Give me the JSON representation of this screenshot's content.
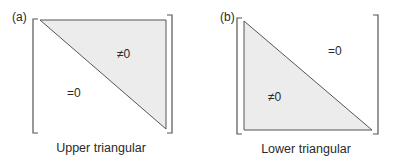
{
  "figure": {
    "colors": {
      "fill": "#ececec",
      "stroke": "#555555",
      "text": "#2a2a2a"
    },
    "panels": [
      {
        "id": "a",
        "label": "(a)",
        "caption": "Upper triangular",
        "nonzero_label": "≠0",
        "zero_label": "=0"
      },
      {
        "id": "b",
        "label": "(b)",
        "caption": "Lower triangular",
        "nonzero_label": "≠0",
        "zero_label": "=0"
      }
    ]
  }
}
